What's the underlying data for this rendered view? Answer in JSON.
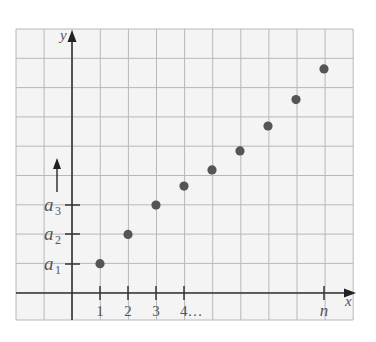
{
  "chart_data": {
    "type": "scatter",
    "title": "",
    "xlabel": "x",
    "ylabel": "y",
    "x_tick_labels": [
      "1",
      "2",
      "3",
      "4…",
      "n"
    ],
    "y_tick_labels": [
      "a1",
      "a2",
      "a3"
    ],
    "annotation": "upward arrow beside y-axis above a3 indicating sequence continues",
    "grid": true,
    "points": [
      {
        "x": 1,
        "y": 1.0
      },
      {
        "x": 2,
        "y": 2.0
      },
      {
        "x": 3,
        "y": 3.0
      },
      {
        "x": 4,
        "y": 3.65
      },
      {
        "x": 5,
        "y": 4.2
      },
      {
        "x": 6,
        "y": 4.85
      },
      {
        "x": 7,
        "y": 5.7
      },
      {
        "x": 8,
        "y": 6.6
      },
      {
        "x": 9,
        "y": 7.65
      }
    ],
    "xlim": [
      -2,
      10
    ],
    "ylim": [
      -1,
      9
    ],
    "colors": {
      "grid": "#b8b8b8",
      "axes": "#333333",
      "points": "#555555",
      "background": "#f4f4f4"
    }
  },
  "labels": {
    "x_axis": "x",
    "y_axis": "y",
    "x_ticks": [
      "1",
      "2",
      "3",
      "4…"
    ],
    "x_last": "n",
    "a1_base": "a",
    "a1_sub": "1",
    "a2_base": "a",
    "a2_sub": "2",
    "a3_base": "a",
    "a3_sub": "3"
  }
}
